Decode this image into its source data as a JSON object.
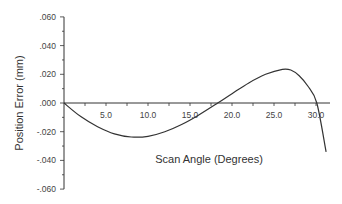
{
  "chart_data": {
    "type": "line",
    "title": "",
    "xlabel": "Scan Angle (Degrees)",
    "ylabel": "Position Error (mm)",
    "xlim": [
      0,
      31.5
    ],
    "ylim": [
      -0.06,
      0.06
    ],
    "grid": false,
    "legend": null,
    "x_ticks": [
      "5.0",
      "10.0",
      "15.0",
      "20.0",
      "25.0",
      "30.0"
    ],
    "x_tick_values": [
      5,
      10,
      15,
      20,
      25,
      30
    ],
    "y_ticks": [
      ".060",
      ".040",
      ".020",
      ".000",
      "-.020",
      "-.040",
      "-.060"
    ],
    "y_tick_values": [
      0.06,
      0.04,
      0.02,
      0.0,
      -0.02,
      -0.04,
      -0.06
    ],
    "series": [
      {
        "name": "Position Error",
        "color": "#333333",
        "x": [
          0,
          2,
          4,
          6,
          8,
          10,
          12,
          14,
          16,
          18.3,
          20,
          22,
          24,
          26,
          27,
          28,
          29,
          30.1,
          31.2
        ],
        "y": [
          0,
          -0.0095,
          -0.0165,
          -0.0215,
          -0.0237,
          -0.0232,
          -0.02,
          -0.015,
          -0.0085,
          0,
          0.0065,
          0.014,
          0.02,
          0.0235,
          0.023,
          0.019,
          0.012,
          0,
          -0.034
        ]
      }
    ]
  }
}
